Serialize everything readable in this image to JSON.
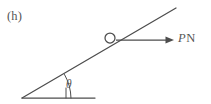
{
  "figure": {
    "panel_label": "(h)",
    "domain_type": "diagram",
    "stroke_color": "#4d4d4d",
    "text_color": "#555555",
    "background_color": "#ffffff",
    "labels": {
      "force_symbol": "P",
      "force_unit": "N",
      "force_full": "PN",
      "angle_symbol": "θ"
    },
    "geometry": {
      "incline_start": [
        22,
        98
      ],
      "incline_end": [
        176,
        8
      ],
      "baseline_start": [
        22,
        98
      ],
      "baseline_end": [
        95,
        98
      ],
      "particle_center": [
        110,
        38
      ],
      "particle_radius": 5,
      "force_arrow_start": [
        116,
        40
      ],
      "force_arrow_end": [
        174,
        40
      ],
      "angle_vertex": [
        22,
        98
      ],
      "angle_tick_x": 66,
      "angle_degrees": 30
    }
  }
}
